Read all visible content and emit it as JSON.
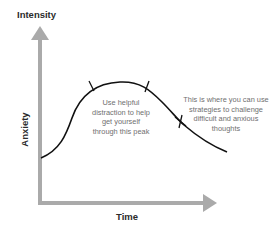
{
  "diagram": {
    "y_axis_top_label": "Intensity",
    "y_axis_side_label": "Anxiety",
    "x_axis_label": "Time",
    "annotations": {
      "peak": {
        "lines": [
          "Use helpful",
          "distraction to help",
          "get yourself",
          "through this peak"
        ]
      },
      "challenge": {
        "lines": [
          "This is where you can use",
          "strategies to challenge",
          "difficult and anxious",
          "thoughts"
        ]
      }
    },
    "colors": {
      "axis": "#aaaaaa",
      "curve": "#111111",
      "text": "#6f6f6f",
      "title": "#2b2b2b",
      "background": "#ffffff"
    },
    "markers": [
      {
        "type": "tick",
        "label": "peak-start"
      },
      {
        "type": "tick",
        "label": "peak-end"
      },
      {
        "type": "cross",
        "label": "challenge-point"
      }
    ]
  }
}
